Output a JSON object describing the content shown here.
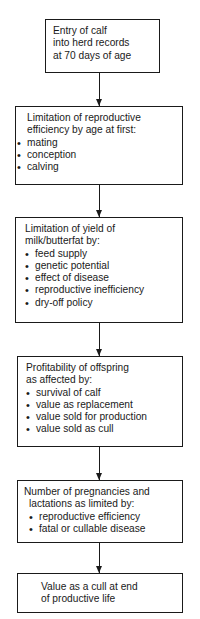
{
  "flowchart": {
    "boxes": [
      {
        "id": "entry",
        "title_lines": [
          "Entry of calf",
          "into herd records",
          "at 70 days of age"
        ],
        "bullets": []
      },
      {
        "id": "reproductive-efficiency",
        "title_lines": [
          "Limitation of reproductive",
          "efficiency by age at first:"
        ],
        "bullets": [
          "mating",
          "conception",
          "calving"
        ]
      },
      {
        "id": "yield",
        "title_lines": [
          "Limitation of yield of",
          "milk/butterfat by:"
        ],
        "bullets": [
          "feed supply",
          "genetic potential",
          "effect of disease",
          "reproductive inefficiency",
          "dry-off policy"
        ]
      },
      {
        "id": "offspring-profitability",
        "title_lines": [
          "Profitability of offspring",
          "as affected by:"
        ],
        "bullets": [
          "survival of calf",
          "value as replacement",
          "value sold for production",
          "value sold as cull"
        ]
      },
      {
        "id": "pregnancies-lactations",
        "title_lines": [
          "Number of pregnancies and",
          "lactations as limited by:"
        ],
        "bullets": [
          "reproductive efficiency",
          "fatal or cullable disease"
        ]
      },
      {
        "id": "cull-value",
        "title_lines": [
          "Value as a cull at end",
          "of productive life"
        ],
        "bullets": []
      }
    ],
    "arrows": [
      {
        "from": "entry",
        "to": "reproductive-efficiency"
      },
      {
        "from": "reproductive-efficiency",
        "to": "yield"
      },
      {
        "from": "yield",
        "to": "offspring-profitability"
      },
      {
        "from": "offspring-profitability",
        "to": "pregnancies-lactations"
      },
      {
        "from": "pregnancies-lactations",
        "to": "cull-value"
      }
    ],
    "colors": {
      "line": "#1a1a1a",
      "background": "#ffffff"
    }
  }
}
